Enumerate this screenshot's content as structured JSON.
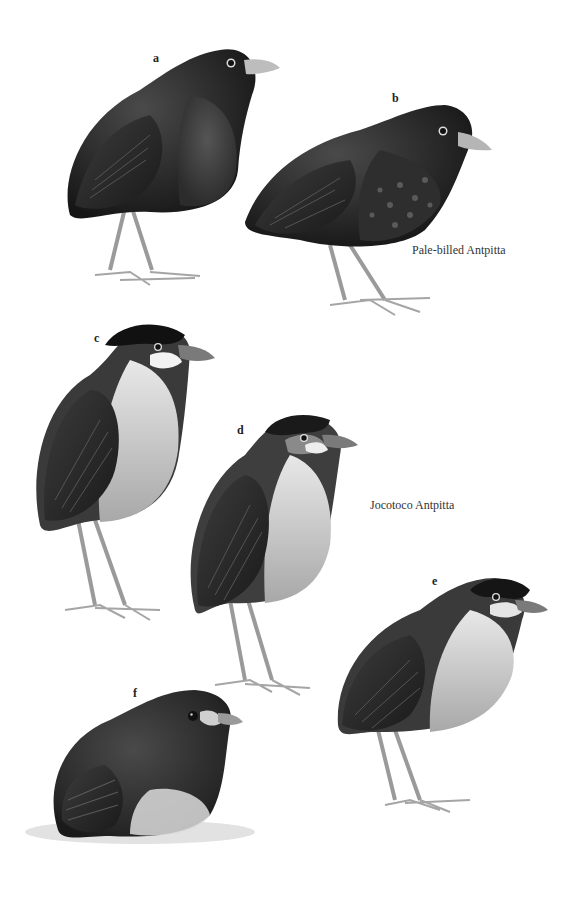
{
  "plate": {
    "background": "#ffffff",
    "figures": [
      {
        "id": "a",
        "label": "a",
        "species": "Pale-billed Antpitta",
        "description": "dark adult, pale bill, scaled breast"
      },
      {
        "id": "b",
        "label": "b",
        "species": "Pale-billed Antpitta",
        "description": "dark bird with spotted underparts"
      },
      {
        "id": "c",
        "label": "c",
        "species": "Jocotoco Antpitta",
        "description": "black crown, white cheek patch, pale underparts"
      },
      {
        "id": "d",
        "label": "d",
        "species": "Jocotoco Antpitta",
        "description": "gray-headed bird with white cheek"
      },
      {
        "id": "e",
        "label": "e",
        "species": "Jocotoco Antpitta",
        "description": "crouched bird, black cap, pale throat"
      },
      {
        "id": "f",
        "label": "f",
        "species": "Jocotoco Antpitta",
        "description": "fluffy juvenile sitting on ground"
      }
    ],
    "captions": {
      "pale_billed": "Pale-billed Antpitta",
      "jocotoco": "Jocotoco Antpitta"
    },
    "colors": {
      "dark_plumage": "#1c1c1c",
      "mid_plumage": "#3a3a3a",
      "pale_underparts": "#c9c9c9",
      "bill": "#b5b5b5",
      "legs": "#9a9a9a"
    }
  }
}
